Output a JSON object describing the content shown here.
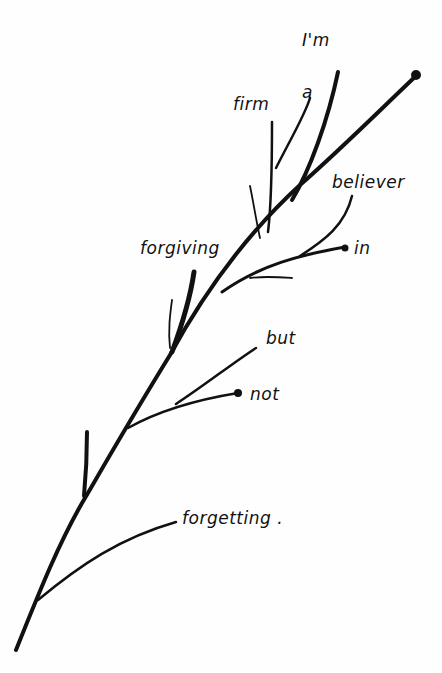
{
  "colors": {
    "ink": "#111111",
    "paper": "#fefefe"
  },
  "words": [
    {
      "id": "im",
      "text": "I'm",
      "x": 302,
      "y": 30
    },
    {
      "id": "a",
      "text": "a",
      "x": 302,
      "y": 82
    },
    {
      "id": "firm",
      "text": "firm",
      "x": 233,
      "y": 94
    },
    {
      "id": "believer",
      "text": "believer",
      "x": 332,
      "y": 172
    },
    {
      "id": "forgiving",
      "text": "forgiving",
      "x": 140,
      "y": 238
    },
    {
      "id": "in",
      "text": "in",
      "x": 354,
      "y": 238
    },
    {
      "id": "but",
      "text": "but",
      "x": 266,
      "y": 328
    },
    {
      "id": "not",
      "text": "not",
      "x": 250,
      "y": 384
    },
    {
      "id": "forgetting",
      "text": "forgetting .",
      "x": 182,
      "y": 508
    }
  ]
}
